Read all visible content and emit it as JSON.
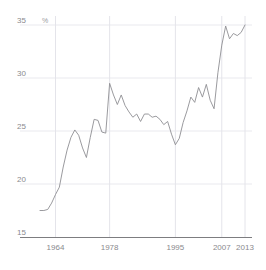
{
  "chart_data": {
    "type": "line",
    "title": "",
    "xlabel": "",
    "ylabel": "",
    "unit_label": "%",
    "ylim": [
      15,
      35
    ],
    "xlim": [
      1960,
      2013
    ],
    "grid": true,
    "legend": "none",
    "yticks": [
      "35",
      "30",
      "25",
      "20",
      "15"
    ],
    "ytick_values": [
      35,
      30,
      25,
      20,
      15
    ],
    "xticks": [
      "1964",
      "1978",
      "1995",
      "2007",
      "2013"
    ],
    "xtick_values": [
      1964,
      1978,
      1995,
      2007,
      2013
    ],
    "series": [
      {
        "name": "share",
        "color": "#8f8f93",
        "x": [
          1960,
          1961,
          1962,
          1963,
          1964,
          1965,
          1966,
          1967,
          1968,
          1969,
          1970,
          1971,
          1972,
          1973,
          1974,
          1975,
          1976,
          1977,
          1978,
          1979,
          1980,
          1981,
          1982,
          1983,
          1984,
          1985,
          1986,
          1987,
          1988,
          1989,
          1990,
          1991,
          1992,
          1993,
          1994,
          1995,
          1996,
          1997,
          1998,
          1999,
          2000,
          2001,
          2002,
          2003,
          2004,
          2005,
          2006,
          2007,
          2008,
          2009,
          2010,
          2011,
          2012,
          2013
        ],
        "values": [
          17.5,
          17.5,
          17.6,
          18.2,
          19.0,
          19.7,
          21.6,
          23.2,
          24.4,
          25.1,
          24.6,
          23.4,
          22.5,
          24.4,
          26.1,
          26.0,
          24.9,
          24.8,
          29.5,
          28.4,
          27.5,
          28.4,
          27.4,
          26.8,
          26.3,
          26.6,
          25.9,
          26.6,
          26.6,
          26.3,
          26.4,
          26.1,
          25.6,
          25.9,
          24.7,
          23.7,
          24.3,
          25.8,
          26.9,
          28.2,
          27.7,
          29.1,
          28.2,
          29.4,
          27.9,
          27.1,
          30.5,
          33.1,
          34.9,
          33.7,
          34.2,
          34.0,
          34.3,
          35.0
        ]
      }
    ]
  }
}
